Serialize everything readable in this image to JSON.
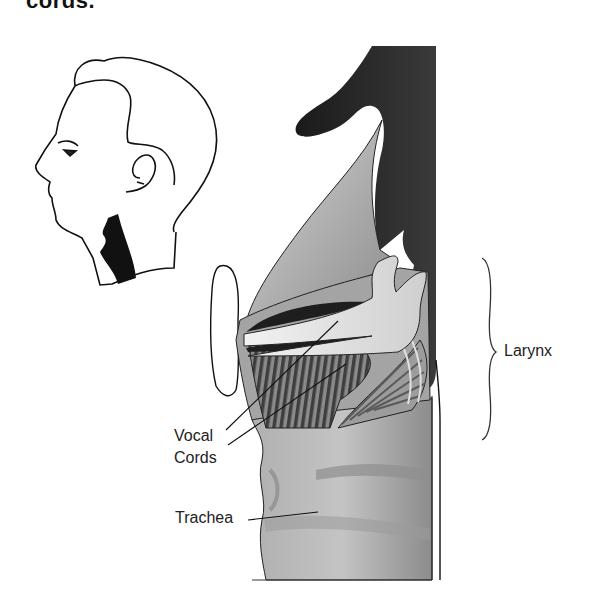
{
  "figure": {
    "title_fragment": "cords.",
    "labels": {
      "vocal": "Vocal",
      "cords": "Cords",
      "trachea": "Trachea",
      "larynx": "Larynx"
    },
    "inset": "head-profile-with-throat-highlight",
    "colors": {
      "outline": "#111111",
      "dark_tissue": "#2a2a2a",
      "mid_gray": "#9a9a9a",
      "light_gray": "#c8c8c8",
      "muscle_stripe": "#555555",
      "background": "#ffffff"
    }
  }
}
